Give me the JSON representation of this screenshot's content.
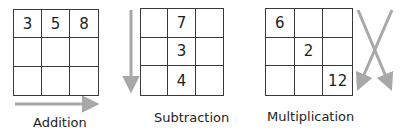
{
  "diagram": {
    "panels": [
      {
        "label": "Addition",
        "direction": "left-to-right",
        "cells": [
          "3",
          "5",
          "8",
          "",
          "",
          "",
          "",
          "",
          ""
        ]
      },
      {
        "label": "Subtraction",
        "direction": "top-to-bottom",
        "cells": [
          "",
          "7",
          "",
          "",
          "3",
          "",
          "",
          "4",
          ""
        ]
      },
      {
        "label": "Multiplication",
        "direction": "diagonal",
        "cells": [
          "6",
          "",
          "",
          "",
          "2",
          "",
          "",
          "",
          "12"
        ]
      }
    ],
    "colors": {
      "grid_line": "#3a3a3a",
      "arrow": "#a8a8a8",
      "text": "#1e1e1e"
    }
  }
}
